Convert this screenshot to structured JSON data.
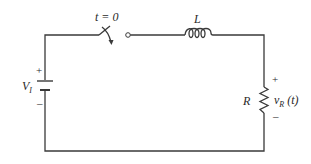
{
  "diagram": {
    "type": "circuit",
    "components": {
      "source": {
        "label": "V",
        "subscript": "I",
        "plus": "+",
        "minus": "–"
      },
      "switch": {
        "label": "t = 0"
      },
      "inductor": {
        "label": "L"
      },
      "resistor": {
        "label": "R",
        "voltage_label": "v",
        "voltage_subscript": "R",
        "voltage_arg": " (t)",
        "plus": "+",
        "minus": "–"
      }
    },
    "colors": {
      "line": "#3a3a3a",
      "background": "#ffffff"
    }
  }
}
